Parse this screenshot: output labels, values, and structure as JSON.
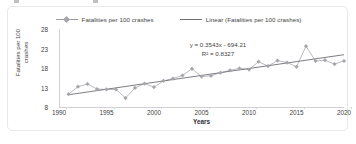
{
  "legend": {
    "position": "top-center",
    "entries": [
      {
        "label": "Fatalities per 100 crashes",
        "marker": "diamond-marker",
        "color": "#a6a6ac"
      },
      {
        "label": "Linear (Fatalities per 100 crashes)",
        "marker": "line-marker",
        "color": "#6f6f74"
      }
    ]
  },
  "annotation": {
    "equation": "y = 0.3543x - 694.21",
    "r_squared": "R² = 0.8327"
  },
  "axes": {
    "x_title": "Years",
    "y_title": "Fatalities per 100 crashes"
  },
  "caption": {
    "text": ""
  },
  "chart_data": {
    "type": "line",
    "title": "",
    "subtitle": "",
    "xlabel": "Years",
    "ylabel": "Fatalities per 100 crashes",
    "xlim": [
      1990,
      2020
    ],
    "ylim": [
      8,
      28
    ],
    "xticks": [
      1990,
      1995,
      2000,
      2005,
      2010,
      2015,
      2020
    ],
    "yticks": [
      8,
      13,
      18,
      23,
      28
    ],
    "grid": false,
    "legend_position": "top-center",
    "annotations": [
      "y = 0.3543x - 694.21",
      "R² = 0.8327"
    ],
    "x": [
      1991,
      1992,
      1993,
      1994,
      1995,
      1996,
      1997,
      1998,
      1999,
      2000,
      2001,
      2002,
      2003,
      2004,
      2005,
      2006,
      2007,
      2008,
      2009,
      2010,
      2011,
      2012,
      2013,
      2014,
      2015,
      2016,
      2017,
      2018,
      2019,
      2020
    ],
    "series": [
      {
        "name": "Fatalities per 100 crashes",
        "type": "line",
        "marker": "diamond",
        "color": "#a6a6ac",
        "values": [
          11.3,
          13.2,
          13.9,
          12.6,
          12.5,
          12.5,
          10.3,
          12.9,
          14.0,
          13.1,
          14.7,
          15.3,
          16.1,
          17.8,
          15.8,
          16.0,
          16.8,
          17.4,
          17.9,
          17.6,
          19.6,
          18.5,
          19.9,
          19.4,
          18.3,
          23.6,
          19.8,
          20.0,
          19.0,
          19.8
        ]
      },
      {
        "name": "Linear (Fatalities per 100 crashes)",
        "type": "trendline",
        "color": "#6f6f74",
        "slope": 0.3543,
        "intercept": -694.21,
        "r_squared": 0.8327,
        "endpoints": [
          {
            "x": 1991,
            "y": 11.14
          },
          {
            "x": 2020,
            "y": 21.41
          }
        ]
      }
    ]
  }
}
